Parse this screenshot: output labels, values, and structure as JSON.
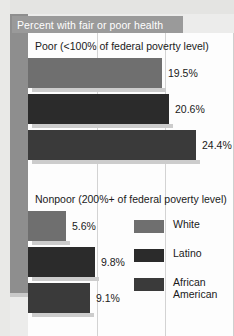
{
  "title": "Percent with fair or poor health",
  "chart_data": {
    "type": "bar",
    "orientation": "horizontal",
    "title": "Percent with fair or poor health",
    "xlabel": "",
    "ylabel": "",
    "xlim": [
      0,
      30
    ],
    "grid": true,
    "gridlines_at": [
      10,
      20,
      30
    ],
    "legend_position": "inside-right",
    "groups": [
      {
        "label": "Poor (<100% of federal poverty level)",
        "bars": [
          {
            "series": "White",
            "value": 19.5,
            "value_label": "19.5%",
            "color": "#6f6f6f"
          },
          {
            "series": "Latino",
            "value": 20.6,
            "value_label": "20.6%",
            "color": "#2b2b2b"
          },
          {
            "series": "African American",
            "value": 24.4,
            "value_label": "24.4%",
            "color": "#3a3a3a"
          }
        ]
      },
      {
        "label": "Nonpoor (200%+ of federal poverty level)",
        "bars": [
          {
            "series": "White",
            "value": 5.6,
            "value_label": "5.6%",
            "color": "#6f6f6f"
          },
          {
            "series": "Latino",
            "value": 9.8,
            "value_label": "9.8%",
            "color": "#2b2b2b"
          },
          {
            "series": "African American",
            "value": 9.1,
            "value_label": "9.1%",
            "color": "#3a3a3a"
          }
        ]
      }
    ],
    "legend": [
      {
        "label": "White",
        "color": "#6f6f6f"
      },
      {
        "label": "Latino",
        "color": "#2b2b2b"
      },
      {
        "label": "African American",
        "color": "#3a3a3a"
      }
    ]
  },
  "colors": {
    "title_band": "#9a9a9a",
    "spine": "#8e8e8e",
    "plot_background": "#fdfdfd",
    "gridline": "#d3d3d3",
    "bar_shadow": "#cccccc"
  }
}
